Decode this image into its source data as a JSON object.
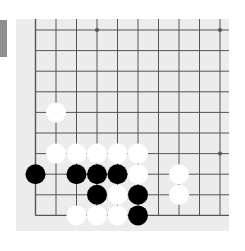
{
  "view": {
    "description": "Lower-left quadrant of a 19x19 Go board",
    "board_size": 19,
    "visible_columns": 10,
    "visible_rows": 10,
    "edges": [
      "left",
      "bottom"
    ]
  },
  "colors": {
    "background": "#ffffff",
    "board": "#ececec",
    "grid_line": "#555555",
    "side_tab": "#8f8f8f",
    "black_stone": "#000000",
    "white_stone": "#ffffff"
  },
  "grid": {
    "origin_x": 19.5,
    "origin_y": 11,
    "spacing_x": 20.5,
    "spacing_y": 20.6,
    "star_points": [
      [
        3,
        0
      ],
      [
        9,
        0
      ],
      [
        3,
        6
      ],
      [
        9,
        6
      ]
    ]
  },
  "stones": [
    {
      "col": 1,
      "row": 4,
      "color": "white"
    },
    {
      "col": 1,
      "row": 6,
      "color": "white"
    },
    {
      "col": 2,
      "row": 6,
      "color": "white"
    },
    {
      "col": 3,
      "row": 6,
      "color": "white"
    },
    {
      "col": 4,
      "row": 6,
      "color": "white"
    },
    {
      "col": 5,
      "row": 6,
      "color": "white"
    },
    {
      "col": 0,
      "row": 7,
      "color": "black"
    },
    {
      "col": 2,
      "row": 7,
      "color": "black"
    },
    {
      "col": 3,
      "row": 7,
      "color": "black"
    },
    {
      "col": 4,
      "row": 7,
      "color": "black"
    },
    {
      "col": 5,
      "row": 7,
      "color": "white"
    },
    {
      "col": 7,
      "row": 7,
      "color": "white"
    },
    {
      "col": 3,
      "row": 8,
      "color": "black"
    },
    {
      "col": 4,
      "row": 8,
      "color": "white"
    },
    {
      "col": 5,
      "row": 8,
      "color": "black"
    },
    {
      "col": 7,
      "row": 8,
      "color": "white"
    },
    {
      "col": 2,
      "row": 9,
      "color": "white"
    },
    {
      "col": 3,
      "row": 9,
      "color": "white"
    },
    {
      "col": 4,
      "row": 9,
      "color": "white"
    },
    {
      "col": 5,
      "row": 9,
      "color": "black"
    }
  ]
}
